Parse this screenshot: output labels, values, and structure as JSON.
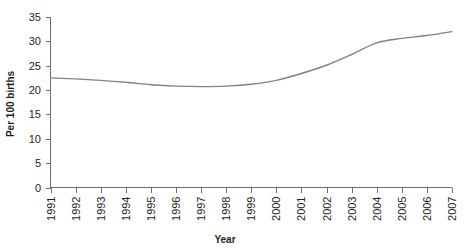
{
  "chart_data": {
    "type": "line",
    "title": "",
    "xlabel": "Year",
    "ylabel": "Per 100 births",
    "x": [
      1991,
      1992,
      1993,
      1994,
      1995,
      1996,
      1997,
      1998,
      1999,
      2000,
      2001,
      2002,
      2003,
      2004,
      2005,
      2006,
      2007
    ],
    "categories": [
      "1991",
      "1992",
      "1993",
      "1994",
      "1995",
      "1996",
      "1997",
      "1998",
      "1999",
      "2000",
      "2001",
      "2002",
      "2003",
      "2004",
      "2005",
      "2006",
      "2007"
    ],
    "values": [
      22.5,
      22.3,
      22.0,
      21.6,
      21.1,
      20.8,
      20.7,
      20.8,
      21.2,
      22.0,
      23.4,
      25.1,
      27.3,
      29.7,
      30.6,
      31.2,
      32.0
    ],
    "series": [
      {
        "name": "Cesarean delivery rate",
        "values": [
          22.5,
          22.3,
          22.0,
          21.6,
          21.1,
          20.8,
          20.7,
          20.8,
          21.2,
          22.0,
          23.4,
          25.1,
          27.3,
          29.7,
          30.6,
          31.2,
          32.0
        ],
        "color": "#808285"
      }
    ],
    "ylim": [
      0,
      35
    ],
    "yticks": [
      0,
      5,
      10,
      15,
      20,
      25,
      30,
      35
    ],
    "ytick_labels": [
      "0",
      "5",
      "10",
      "15",
      "20",
      "25",
      "30",
      "35"
    ],
    "xlim": [
      1991,
      2007
    ],
    "grid": false,
    "legend": "none",
    "line_color": "#808285",
    "axis_color": "#6d6e71",
    "text_color": "#231f20"
  }
}
